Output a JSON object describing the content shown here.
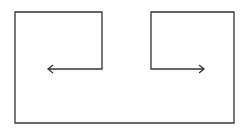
{
  "diagram": {
    "stroke_color": "#333333",
    "background": "#ffffff",
    "path": [
      [
        48,
        69
      ],
      [
        102,
        69
      ],
      [
        102,
        12
      ],
      [
        15,
        12
      ],
      [
        15,
        123
      ],
      [
        234,
        123
      ],
      [
        234,
        12
      ],
      [
        151,
        12
      ],
      [
        151,
        69
      ],
      [
        204,
        69
      ]
    ],
    "arrows": [
      {
        "name": "left-arrow",
        "tip": [
          48,
          69
        ],
        "direction": "left"
      },
      {
        "name": "right-arrow",
        "tip": [
          204,
          69
        ],
        "direction": "right"
      }
    ]
  }
}
